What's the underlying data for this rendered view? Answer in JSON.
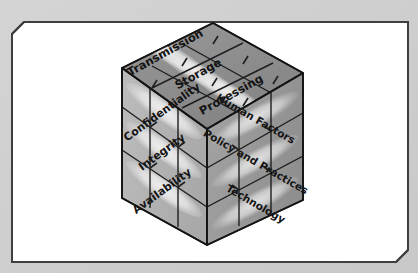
{
  "figure": {
    "name": "mccumber-cube",
    "background_color": "#cfcfcf",
    "page_color": "#ffffff",
    "border_color": "#3a3a3a"
  },
  "cube": {
    "top_face": {
      "name": "information-states-face",
      "fill": "#8e8e8e",
      "labels": [
        {
          "text": "Transmission"
        },
        {
          "text": "Storage"
        },
        {
          "text": "Processing"
        }
      ]
    },
    "left_face": {
      "name": "security-goals-face",
      "fill": "#b4b4b4",
      "labels": [
        {
          "text": "Confidentiality"
        },
        {
          "text": "Integrity"
        },
        {
          "text": "Availability"
        }
      ]
    },
    "right_face": {
      "name": "countermeasures-face",
      "fill": "#9b9b9b",
      "labels": [
        {
          "text": "Human Factors"
        },
        {
          "text": "Policy and Practices"
        },
        {
          "text": "Technology"
        }
      ]
    },
    "edge_color": "#1e1e1e",
    "highlight_color": "#e2e2e2"
  }
}
